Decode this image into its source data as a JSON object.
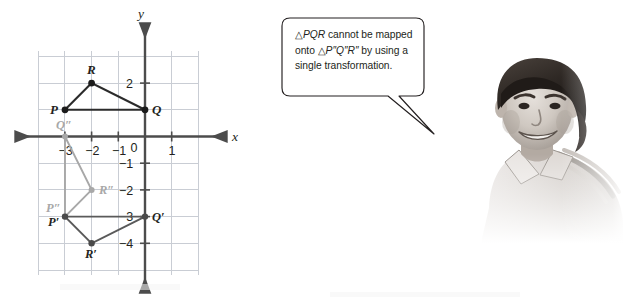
{
  "figure": {
    "type": "coordinate-plane-with-triangles",
    "axes": {
      "x_label": "x",
      "y_label": "y",
      "x_tick_labels": [
        "−3",
        "−2",
        "−1",
        "0",
        "1"
      ],
      "x_tick_values": [
        -3,
        -2,
        -1,
        0,
        1
      ],
      "y_tick_labels": [
        "2",
        "−1",
        "−2",
        "−3",
        "−4"
      ],
      "y_tick_values": [
        2,
        -1,
        -2,
        -3,
        -4
      ],
      "x_range": [
        -4,
        2
      ],
      "y_range": [
        -5,
        3
      ],
      "grid": true,
      "grid_color": "#c9cdd4",
      "axis_color": "#4c4c4c"
    },
    "triangles": [
      {
        "name": "PQR",
        "style": "solid-dark",
        "color": "#2b2b2b",
        "vertices": [
          {
            "label": "P",
            "x": -3,
            "y": 1,
            "label_pos": "left"
          },
          {
            "label": "Q",
            "x": 0,
            "y": 1,
            "label_pos": "right"
          },
          {
            "label": "R",
            "x": -2,
            "y": 2,
            "label_pos": "above"
          }
        ]
      },
      {
        "name": "P'Q'R'",
        "style": "solid-dark",
        "color": "#4a4a4a",
        "vertices": [
          {
            "label": "P′",
            "x": -3,
            "y": -3,
            "label_pos": "below-left"
          },
          {
            "label": "Q′",
            "x": 0,
            "y": -3,
            "label_pos": "right"
          },
          {
            "label": "R′",
            "x": -2,
            "y": -4,
            "label_pos": "below"
          }
        ]
      },
      {
        "name": "P″Q″R″",
        "style": "solid-light",
        "color": "#a8a8a8",
        "vertices": [
          {
            "label": "P″",
            "x": -3,
            "y": -3,
            "label_pos": "above-left"
          },
          {
            "label": "Q″",
            "x": -3,
            "y": 0,
            "label_pos": "above"
          },
          {
            "label": "R″",
            "x": -2,
            "y": -2,
            "label_pos": "right"
          }
        ]
      }
    ]
  },
  "callout": {
    "line1_pre": "△",
    "line1_italic": "PQR",
    "line1_post": " cannot be mapped",
    "line2_pre": "onto ",
    "line2_tri": "△",
    "line2_italic": "P″Q″R″",
    "line2_post": " by using a",
    "line3": "single transformation.",
    "full_text": "△PQR cannot be mapped onto △P″Q″R″ by using a single transformation.",
    "border_color": "#231f20",
    "fill_color": "#ffffff"
  },
  "photo": {
    "alt": "grayscale photo of a smiling young man wearing a striped polo shirt",
    "subject": "student"
  }
}
